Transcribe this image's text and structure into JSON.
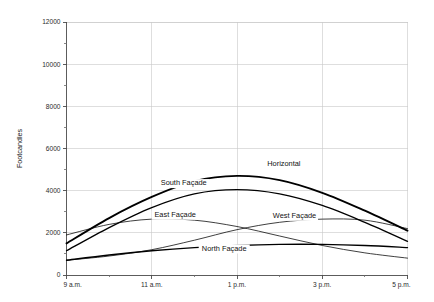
{
  "chart_data": {
    "type": "line",
    "title": "",
    "xlabel": "",
    "ylabel": "Footcandles",
    "ylim": [
      0,
      12000
    ],
    "xlim": [
      9,
      17
    ],
    "grid": true,
    "legend_position": "inline-labels",
    "y_ticks": [
      0,
      2000,
      4000,
      6000,
      8000,
      10000,
      12000
    ],
    "y_tick_labels": [
      "0",
      "2000",
      "4000",
      "6000",
      "8000",
      "10000",
      "12000"
    ],
    "y_minor_ticks": [
      1000,
      3000,
      5000,
      7000,
      9000,
      11000
    ],
    "x_ticks": [
      9,
      11,
      13,
      15,
      17
    ],
    "x_tick_labels": [
      "9 a.m.",
      "11 a.m.",
      "1 p.m.",
      "3 p.m.",
      "5 p.m."
    ],
    "x_hours": [
      9,
      10,
      11,
      12,
      13,
      14,
      15,
      16,
      17
    ],
    "series": [
      {
        "name": "Horizontal",
        "label": "Horizontal",
        "weight": "thick",
        "label_x": 14.1,
        "label_y": 5150,
        "values": [
          1500,
          2700,
          3700,
          4450,
          4700,
          4500,
          3900,
          3050,
          2100
        ]
      },
      {
        "name": "South Façade",
        "label": "South Façade",
        "weight": "med",
        "label_x": 11.75,
        "label_y": 4250,
        "values": [
          1150,
          2250,
          3200,
          3850,
          4050,
          3850,
          3300,
          2500,
          1600
        ]
      },
      {
        "name": "East Façade",
        "label": "East Façade",
        "weight": "thin",
        "label_x": 11.55,
        "label_y": 2750,
        "values": [
          1900,
          2400,
          2650,
          2600,
          2300,
          1850,
          1400,
          1050,
          800
        ]
      },
      {
        "name": "West Façade",
        "label": "West Façade",
        "weight": "thin",
        "label_x": 14.35,
        "label_y": 2700,
        "values": [
          700,
          900,
          1200,
          1650,
          2150,
          2500,
          2650,
          2600,
          2200
        ]
      },
      {
        "name": "North Façade",
        "label": "North Façade",
        "weight": "med",
        "label_x": 12.7,
        "label_y": 1150,
        "values": [
          700,
          950,
          1150,
          1300,
          1400,
          1450,
          1450,
          1400,
          1300
        ]
      }
    ]
  }
}
